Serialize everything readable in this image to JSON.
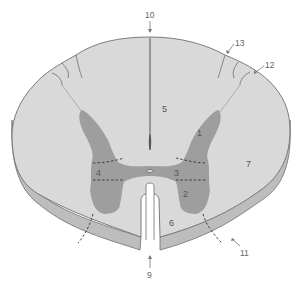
{
  "diagram": {
    "type": "spinal-cord-cross-section",
    "colors": {
      "white_matter": "#d9d9d9",
      "gray_matter": "#9e9e9e",
      "outline": "#6f6f6f",
      "underside": "#bdbdbd",
      "background": "#ffffff"
    },
    "labels": {
      "l1": "1",
      "l2": "2",
      "l3": "3",
      "l4": "4",
      "l5": "5",
      "l6": "6",
      "l7": "7",
      "l9": "9",
      "l10": "10",
      "l11": "11",
      "l12": "12",
      "l13": "13"
    }
  }
}
